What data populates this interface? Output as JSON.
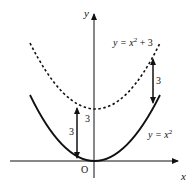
{
  "diagram": {
    "axes": {
      "x_label": "x",
      "y_label": "y",
      "origin_label": "O"
    },
    "curves": [
      {
        "name": "y = x^2",
        "style": "solid",
        "label_main": "y = x",
        "label_exp": "2",
        "label_tail": ""
      },
      {
        "name": "y = x^2 + 3",
        "style": "dashed",
        "label_main": "y = x",
        "label_exp": "2",
        "label_tail": " + 3"
      }
    ],
    "shift_labels": {
      "left_arrow": "3",
      "axis_offset": "3",
      "right_arrow": "3"
    },
    "colors": {
      "stroke": "#111111",
      "background": "#ffffff"
    }
  }
}
